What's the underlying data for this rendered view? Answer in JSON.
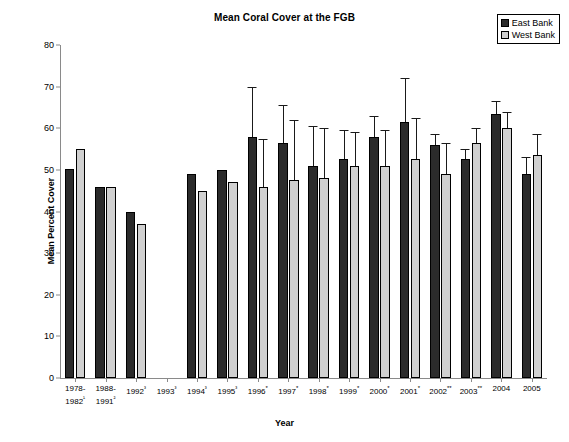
{
  "chart_data": {
    "type": "bar",
    "title": "Mean Coral Cover at the FGB",
    "xlabel": "Year",
    "ylabel": "Mean Percent Cover",
    "ylim": [
      0,
      80
    ],
    "yticks": [
      0,
      10,
      20,
      30,
      40,
      50,
      60,
      70,
      80
    ],
    "grid": false,
    "legend_position": "top-right",
    "legend": [
      "East Bank",
      "West Bank"
    ],
    "categories": [
      "1978-\n1982¹",
      "1988-\n1991²",
      "1992³",
      "1993³",
      "1994³",
      "1995³",
      "1996*",
      "1997*",
      "1998*",
      "1999*",
      "2000*",
      "2001*",
      "2002**",
      "2003**",
      "2004",
      "2005"
    ],
    "series": [
      {
        "name": "East Bank",
        "color": "#2b2b2b",
        "values": [
          50.2,
          46.0,
          40.0,
          null,
          49.0,
          50.0,
          58.0,
          56.5,
          51.0,
          52.5,
          58.0,
          61.5,
          56.0,
          52.5,
          63.5,
          49.0
        ],
        "errors_upper": [
          null,
          null,
          null,
          null,
          null,
          null,
          70.0,
          65.5,
          60.5,
          59.5,
          63.0,
          72.0,
          58.5,
          55.0,
          66.5,
          53.0
        ]
      },
      {
        "name": "West Bank",
        "color": "#d0d0d0",
        "values": [
          55.0,
          46.0,
          37.0,
          null,
          45.0,
          47.0,
          46.0,
          47.5,
          48.0,
          51.0,
          51.0,
          52.5,
          49.0,
          56.5,
          60.0,
          53.5
        ],
        "errors_upper": [
          null,
          null,
          null,
          null,
          null,
          null,
          57.5,
          62.0,
          60.0,
          59.0,
          59.5,
          62.5,
          56.5,
          60.0,
          64.0,
          58.5
        ]
      }
    ]
  }
}
